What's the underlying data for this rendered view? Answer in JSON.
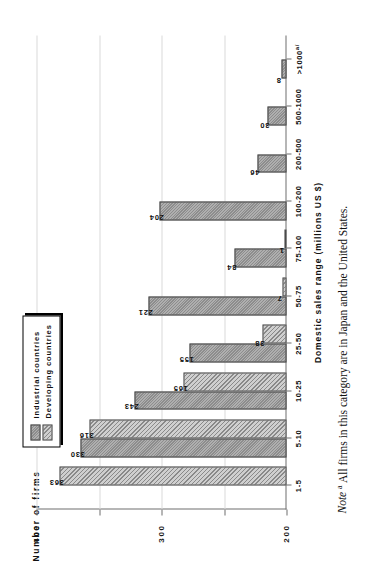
{
  "figure": {
    "orientation": "rotated-90-ccw",
    "note_word": "Note",
    "note_marker": "a",
    "note_text": " All firms in this category are in Japan and the United States.",
    "legend_title": "legend-box"
  },
  "legend": {
    "items": [
      {
        "label": "Industrial countries",
        "key": "industrial",
        "color": "#8d8d8d"
      },
      {
        "label": "Developing countries",
        "key": "developing",
        "color": "#cfcfcf"
      }
    ]
  },
  "chart_data": {
    "type": "bar",
    "title": "",
    "xlabel": "Domestic sales range (millions US $)",
    "ylabel": "Number of firms",
    "ylim": [
      0,
      400
    ],
    "yticks": [
      "0",
      "100",
      "200",
      "300",
      "400"
    ],
    "ytick_values": [
      0,
      100,
      200,
      300,
      400
    ],
    "grid": true,
    "legend_position": "top-left",
    "categories": [
      "1-5",
      "5-10",
      "10-25",
      "25-50",
      "50-75",
      "75-100",
      "100-200",
      "200-500",
      "500-1000",
      ">1000"
    ],
    "category_footnotes": [
      "",
      "",
      "",
      "",
      "",
      "",
      "",
      "",
      "",
      "a/"
    ],
    "series": [
      {
        "name": "Industrial countries",
        "key": "industrial",
        "values": [
          0,
          330,
          243,
          155,
          221,
          84,
          204,
          46,
          30,
          8
        ],
        "labels": [
          "",
          "330",
          "243",
          "155",
          "221",
          "84",
          "204",
          "46",
          "30",
          "8"
        ]
      },
      {
        "name": "Developing countries",
        "key": "developing",
        "values": [
          363,
          316,
          165,
          38,
          7,
          1,
          0,
          0,
          0,
          0
        ],
        "labels": [
          "363",
          "316",
          "165",
          "38",
          "7",
          "1",
          "",
          "",
          "",
          ""
        ]
      }
    ]
  }
}
